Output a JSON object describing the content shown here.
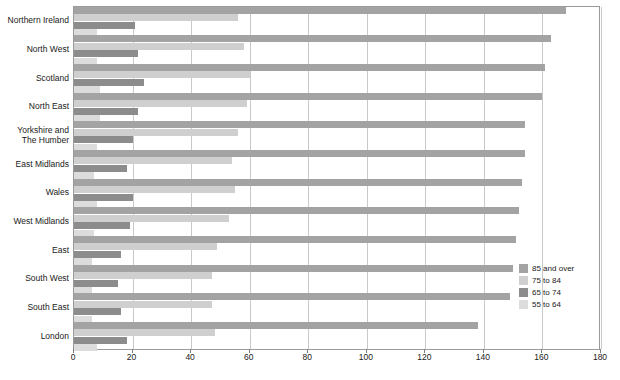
{
  "chart_data": {
    "type": "bar",
    "orientation": "horizontal",
    "title": "",
    "subtitle": "",
    "xlabel": "",
    "ylabel": "",
    "xlim": [
      0,
      180
    ],
    "xticks": [
      0,
      20,
      40,
      60,
      80,
      100,
      120,
      140,
      160,
      180
    ],
    "grid": "vertical",
    "legend_position": "bottom-right",
    "categories": [
      "Northern Ireland",
      "North West",
      "Scotland",
      "North East",
      "Yorkshire and\nThe Humber",
      "East Midlands",
      "Wales",
      "West Midlands",
      "East",
      "South West",
      "South East",
      "London"
    ],
    "series": [
      {
        "name": "85 and over",
        "color": "#a3a3a3",
        "values": [
          168,
          163,
          161,
          160,
          154,
          154,
          153,
          152,
          151,
          150,
          149,
          138
        ]
      },
      {
        "name": "75 to 84",
        "color": "#cfcfcf",
        "values": [
          56,
          58,
          60,
          59,
          56,
          54,
          55,
          53,
          49,
          47,
          47,
          48
        ]
      },
      {
        "name": "65 to 74",
        "color": "#8c8c8c",
        "values": [
          21,
          22,
          24,
          22,
          20,
          18,
          20,
          19,
          16,
          15,
          16,
          18
        ]
      },
      {
        "name": "55 to 64",
        "color": "#dcdcdc",
        "values": [
          8,
          8,
          9,
          9,
          8,
          7,
          8,
          7,
          6,
          6,
          6,
          8
        ]
      }
    ]
  },
  "legend": {
    "items": [
      {
        "label": "85 and over",
        "color": "#a3a3a3"
      },
      {
        "label": "75 to 84",
        "color": "#cfcfcf"
      },
      {
        "label": "65 to 74",
        "color": "#8c8c8c"
      },
      {
        "label": "55 to 64",
        "color": "#dcdcdc"
      }
    ]
  },
  "axis": {
    "x_tick_labels": [
      "0",
      "20",
      "40",
      "60",
      "80",
      "100",
      "120",
      "140",
      "160",
      "180"
    ]
  }
}
